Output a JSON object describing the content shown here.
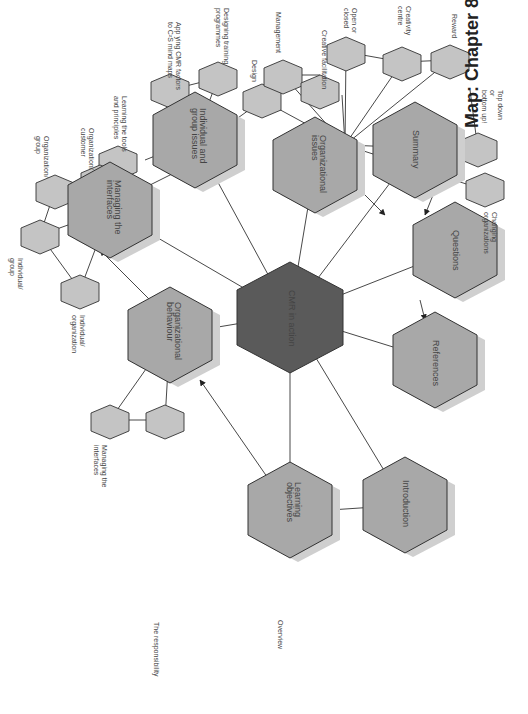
{
  "title": "Map: Chapter 8",
  "colors": {
    "center_fill": "#5a5a5a",
    "main_fill": "#a8a8a8",
    "small_fill": "#c4c4c4",
    "shadow": "#cfcfcf",
    "stroke": "#333333",
    "line": "#333333"
  },
  "center": {
    "label": "CMR in action"
  },
  "main_nodes": [
    {
      "id": "organizational-issues",
      "label": "Organizational issues"
    },
    {
      "id": "individual-group-issues",
      "label": "Individual and group issues"
    },
    {
      "id": "managing-interfaces",
      "label": "Managing the interfaces"
    },
    {
      "id": "organizational-behaviour",
      "label": "Organizational behaviour"
    },
    {
      "id": "learning-objectives",
      "label": "Learning objectives"
    },
    {
      "id": "introduction",
      "label": "Introduction"
    },
    {
      "id": "references",
      "label": "References"
    },
    {
      "id": "questions",
      "label": "Questions"
    },
    {
      "id": "summary",
      "label": "Summary"
    }
  ],
  "sub_labels": {
    "design": "Design",
    "management": "Management",
    "creative_facilitation": "Creative facilitation",
    "open_or_closed": "Open or\nclosed",
    "creativity_centre": "Creativity\ncentre",
    "reward": "Reward",
    "top_down": "Top down\nor\nbottom up!",
    "changing_organizations": "Changing\norganizations",
    "designing_training": "Designing training\nprogrammes",
    "applying_cmr": "App ying CMR factors\nto C²S mind maps",
    "learning_tools": "Learning the tools\nand principles",
    "org_customer": "Organization/\ncustomer",
    "org_group": "Organization/\ngroup",
    "individual_group": "Individual/\ngroup",
    "individual_organization": "Individual/\norganization",
    "managing_the_interfaces": "Managing the\ninterfaces",
    "the_responsibility": "The responsibility",
    "overview": "Overview"
  }
}
